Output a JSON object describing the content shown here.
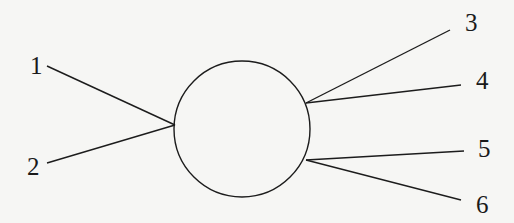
{
  "diagram": {
    "type": "feynman-style vertex diagram",
    "background": "#f6f6f4",
    "stroke_color": "#1c1c1c",
    "blob": {
      "cx": 242,
      "cy": 129,
      "r": 68
    },
    "vertices": {
      "left": {
        "x": 175,
        "y": 125
      },
      "upper_right": {
        "x": 306,
        "y": 103
      },
      "lower_right": {
        "x": 306,
        "y": 160
      }
    },
    "legs": [
      {
        "label": "1",
        "from": {
          "x": 47,
          "y": 66
        },
        "to": {
          "x": 175,
          "y": 125
        },
        "label_pos": {
          "x": 30,
          "y": 74
        }
      },
      {
        "label": "2",
        "from": {
          "x": 47,
          "y": 163
        },
        "to": {
          "x": 175,
          "y": 125
        },
        "label_pos": {
          "x": 27,
          "y": 175
        }
      },
      {
        "label": "3",
        "from": {
          "x": 306,
          "y": 103
        },
        "to": {
          "x": 450,
          "y": 30
        },
        "label_pos": {
          "x": 465,
          "y": 31
        }
      },
      {
        "label": "4",
        "from": {
          "x": 306,
          "y": 103
        },
        "to": {
          "x": 461,
          "y": 85
        },
        "label_pos": {
          "x": 476,
          "y": 89
        }
      },
      {
        "label": "5",
        "from": {
          "x": 306,
          "y": 160
        },
        "to": {
          "x": 464,
          "y": 151
        },
        "label_pos": {
          "x": 478,
          "y": 157
        }
      },
      {
        "label": "6",
        "from": {
          "x": 306,
          "y": 160
        },
        "to": {
          "x": 461,
          "y": 200
        },
        "label_pos": {
          "x": 476,
          "y": 213
        }
      }
    ]
  }
}
